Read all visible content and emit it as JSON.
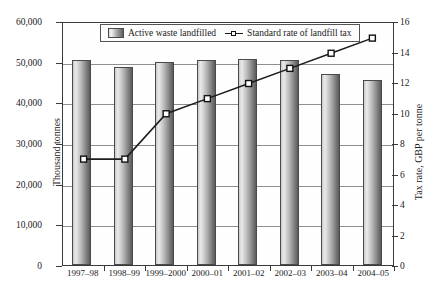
{
  "chart_data": {
    "type": "bar",
    "title": "",
    "categories": [
      "1997–98",
      "1998–99",
      "1999–2000",
      "2000–01",
      "2001–02",
      "2002–03",
      "2003–04",
      "2004–05"
    ],
    "series": [
      {
        "name": "Active waste landfilled",
        "type": "bar",
        "axis": "left",
        "unit": "Thousand tonnes",
        "values": [
          50400,
          48800,
          49800,
          50500,
          50700,
          50400,
          46900,
          45600
        ]
      },
      {
        "name": "Standard rate of landfill tax",
        "type": "line",
        "axis": "right",
        "unit": "GBP per tonne",
        "values": [
          7,
          7,
          10,
          11,
          12,
          13,
          14,
          15
        ]
      }
    ],
    "ylabel": "Thousand tonnes",
    "ylim": [
      0,
      60000
    ],
    "yticks": [
      "0",
      "10,000",
      "20,000",
      "30,000",
      "40,000",
      "50,000",
      "60,000"
    ],
    "ytick_values": [
      0,
      10000,
      20000,
      30000,
      40000,
      50000,
      60000
    ],
    "y2label": "Tax rate, GBP per tonne",
    "y2lim": [
      0,
      16
    ],
    "y2ticks": [
      "0",
      "2",
      "4",
      "6",
      "8",
      "10",
      "12",
      "14",
      "16"
    ],
    "y2tick_values": [
      0,
      2,
      4,
      6,
      8,
      10,
      12,
      14,
      16
    ],
    "xlabel": "",
    "grid": true,
    "legend_position": "top-center",
    "legend": [
      {
        "label": "Active waste landfilled",
        "marker": "bar-swatch"
      },
      {
        "label": "Standard rate of landfill tax",
        "marker": "line-square"
      }
    ],
    "colors": {
      "bar_light": "#eaeaea",
      "bar_dark": "#5a5a5a",
      "line": "#1d1d1d",
      "marker_fill": "#ffffff",
      "axis": "#3a3a3a",
      "grid": "#8e8e8e"
    }
  }
}
